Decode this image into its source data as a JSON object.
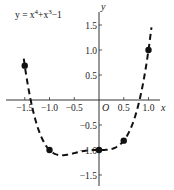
{
  "chart_data": {
    "type": "line",
    "function": "x^4 + x^3 - 1",
    "xlabel": "x",
    "ylabel": "y",
    "origin_label": "O",
    "xlim": [
      -1.6,
      1.3
    ],
    "ylim": [
      -1.7,
      1.6
    ],
    "x_ticks": [
      -1.5,
      -1.0,
      -0.5,
      0.5,
      1.0
    ],
    "x_tick_labels": [
      "−1.5",
      "−1.0",
      "−0.5",
      "0.5",
      "1.0"
    ],
    "y_ticks": [
      1.5,
      1.0,
      0.5,
      -0.5,
      -1.0,
      -1.5
    ],
    "y_tick_labels": [
      "1.5",
      "1.0",
      "0.5",
      "−0.5",
      "−1.0",
      "−1.5"
    ],
    "line_style": "dashed",
    "grid": false,
    "legend": "none",
    "series": [
      {
        "name": "y = x⁴+x³−1",
        "curve_x_range": [
          -1.52,
          1.06
        ],
        "highlighted_points": [
          {
            "x": -1.5,
            "y": 0.6875
          },
          {
            "x": -1.0,
            "y": -1.0
          },
          {
            "x": 0.0,
            "y": -1.0
          },
          {
            "x": 0.5,
            "y": -0.8125
          },
          {
            "x": 1.0,
            "y": 1.0
          }
        ]
      }
    ],
    "colors": {
      "line": "#111111",
      "axis": "#333333",
      "points": "#111111"
    }
  }
}
